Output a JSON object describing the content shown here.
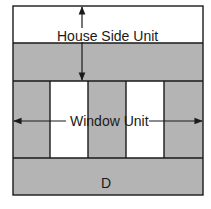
{
  "diagram": {
    "labels": {
      "house_side_unit": "House Side Unit",
      "window_unit": "Window Unit",
      "bottom_section": "D"
    },
    "colors": {
      "fill_gray": "#b4b4b4",
      "fill_white": "#ffffff",
      "stroke": "#1a1a1a"
    },
    "columns": [
      "gray",
      "white",
      "gray",
      "white",
      "gray"
    ]
  }
}
